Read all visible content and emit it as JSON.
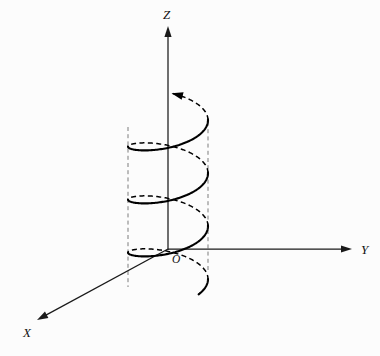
{
  "figure": {
    "background_color": "#fcfcfc",
    "ink_color": "#000000",
    "hidden_line_color": "#7d7d7d",
    "width": 380,
    "height": 356
  },
  "axes": {
    "origin": {
      "label": "O",
      "x": 168,
      "y": 249,
      "label_x": 172,
      "label_y": 263
    },
    "z": {
      "label": "Z",
      "label_x": 163,
      "label_y": 19,
      "from_x": 168,
      "from_y": 250,
      "to_x": 168,
      "to_y": 26,
      "arrow": true,
      "direction": "up"
    },
    "y": {
      "label": "Y",
      "label_x": 361,
      "label_y": 254,
      "from_x": 168,
      "from_y": 249,
      "to_x": 352,
      "to_y": 249,
      "arrow": true,
      "direction": "right"
    },
    "x": {
      "label": "X",
      "label_x": 23,
      "label_y": 337,
      "from_x": 168,
      "from_y": 249,
      "to_x": 37,
      "to_y": 320,
      "arrow": true,
      "direction": "down-left"
    }
  },
  "cylinder": {
    "description": "Vertical circular cylinder whose silhouette generator lines are drawn dashed",
    "center_x": 168,
    "axis_x": 168,
    "semi_axis_a": 40,
    "semi_axis_b": 14.5,
    "left_generator_x": 128,
    "right_generator_x": 208,
    "generator_top_y": 127,
    "generator_bottom_y": 285,
    "generators": [
      {
        "name": "left-generator",
        "x": 128,
        "y1": 127,
        "y2": 287
      },
      {
        "name": "right-generator",
        "x": 208,
        "y1": 122,
        "y2": 270
      }
    ]
  },
  "chart_data": {
    "type": "line",
    "xlabel": "X",
    "ylabel": "Y",
    "zlabel": "Z",
    "projection": {
      "type": "oblique-axonometric",
      "y_axis_screen_dir": [
        1,
        0
      ],
      "z_axis_screen_dir": [
        0,
        -1
      ],
      "x_axis_screen_dir": [
        -0.879,
        0.477
      ]
    },
    "curve": {
      "name": "helix",
      "parametric": "x = a·cos t,  y = a·sin t,  z = c·t",
      "radius_a": 40,
      "pitch_per_turn_px": 53,
      "turns": 3.35,
      "t_start_deg": -40,
      "t_end_deg": 1165,
      "ellipse_semi_a": 40,
      "ellipse_semi_b": 14.5,
      "center_x": 168,
      "base_y": 285,
      "rise_per_degree_px": 0.1472,
      "front_is_solid": true,
      "back_is_dashed": true,
      "arrow_at_end": true
    },
    "annotations": [
      {
        "text": "Z",
        "x": 163,
        "y": 19,
        "style": "italic"
      },
      {
        "text": "Y",
        "x": 361,
        "y": 254,
        "style": "italic"
      },
      {
        "text": "X",
        "x": 23,
        "y": 337,
        "style": "italic"
      },
      {
        "text": "O",
        "x": 172,
        "y": 263,
        "style": "italic"
      }
    ],
    "grid": false,
    "legend": null
  }
}
